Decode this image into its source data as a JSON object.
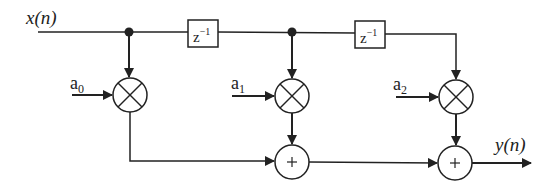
{
  "diagram": {
    "input_label": "x(n)",
    "output_label": "y(n)",
    "delays": [
      {
        "label_base": "z",
        "label_exp": "−1"
      },
      {
        "label_base": "z",
        "label_exp": "−1"
      }
    ],
    "coefficients": [
      {
        "base": "a",
        "sub": "0"
      },
      {
        "base": "a",
        "sub": "1"
      },
      {
        "base": "a",
        "sub": "2"
      }
    ],
    "multiplier_symbol": "×",
    "adder_symbol": "+",
    "colors": {
      "line": "#222222",
      "background": "#ffffff"
    }
  }
}
